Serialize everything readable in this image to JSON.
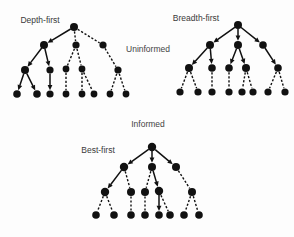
{
  "figure": {
    "width": 294,
    "height": 237,
    "background_color": "#fdfdfd",
    "node_color": "#111111",
    "edge_color": "#111111",
    "label_color": "#3a3a3a"
  },
  "section_labels": [
    {
      "text": "Uninformed",
      "x": 148,
      "y": 52
    },
    {
      "text": "Informed",
      "x": 148,
      "y": 127
    }
  ],
  "trees": [
    {
      "id": "depth-first",
      "label": "Depth-first",
      "label_x": 40,
      "label_y": 23,
      "nodes": [
        {
          "id": "n0",
          "x": 74,
          "y": 27,
          "r": 4.0
        },
        {
          "id": "n1",
          "x": 44,
          "y": 45,
          "r": 4.0
        },
        {
          "id": "n2",
          "x": 76,
          "y": 45,
          "r": 3.6
        },
        {
          "id": "n3",
          "x": 103,
          "y": 45,
          "r": 3.6
        },
        {
          "id": "n4",
          "x": 25,
          "y": 70,
          "r": 4.0
        },
        {
          "id": "n5",
          "x": 50,
          "y": 70,
          "r": 3.6
        },
        {
          "id": "n6",
          "x": 66,
          "y": 69,
          "r": 3.4
        },
        {
          "id": "n7",
          "x": 82,
          "y": 69,
          "r": 3.4
        },
        {
          "id": "n8",
          "x": 118,
          "y": 70,
          "r": 3.6
        },
        {
          "id": "n9",
          "x": 17,
          "y": 94,
          "r": 3.8
        },
        {
          "id": "n10",
          "x": 37,
          "y": 94,
          "r": 3.8
        },
        {
          "id": "n11",
          "x": 50,
          "y": 94,
          "r": 3.6
        },
        {
          "id": "n12",
          "x": 66,
          "y": 94,
          "r": 3.4
        },
        {
          "id": "n13",
          "x": 82,
          "y": 94,
          "r": 3.4
        },
        {
          "id": "n14",
          "x": 94,
          "y": 94,
          "r": 3.4
        },
        {
          "id": "n15",
          "x": 110,
          "y": 94,
          "r": 3.4
        },
        {
          "id": "n16",
          "x": 126,
          "y": 94,
          "r": 3.4
        }
      ],
      "edges": [
        {
          "from": "n0",
          "to": "n1",
          "style": "solid",
          "arrow": true
        },
        {
          "from": "n0",
          "to": "n2",
          "style": "dashed",
          "arrow": false
        },
        {
          "from": "n0",
          "to": "n3",
          "style": "dashed",
          "arrow": false
        },
        {
          "from": "n1",
          "to": "n4",
          "style": "solid",
          "arrow": true
        },
        {
          "from": "n1",
          "to": "n5",
          "style": "solid",
          "arrow": true
        },
        {
          "from": "n2",
          "to": "n6",
          "style": "dashed",
          "arrow": false
        },
        {
          "from": "n2",
          "to": "n7",
          "style": "dashed",
          "arrow": false
        },
        {
          "from": "n3",
          "to": "n8",
          "style": "dashed",
          "arrow": false
        },
        {
          "from": "n4",
          "to": "n9",
          "style": "solid",
          "arrow": true
        },
        {
          "from": "n4",
          "to": "n10",
          "style": "solid",
          "arrow": true
        },
        {
          "from": "n5",
          "to": "n11",
          "style": "solid",
          "arrow": true
        },
        {
          "from": "n6",
          "to": "n12",
          "style": "dashed",
          "arrow": false
        },
        {
          "from": "n7",
          "to": "n13",
          "style": "dashed",
          "arrow": false
        },
        {
          "from": "n7",
          "to": "n14",
          "style": "dashed",
          "arrow": false
        },
        {
          "from": "n8",
          "to": "n15",
          "style": "dashed",
          "arrow": false
        },
        {
          "from": "n8",
          "to": "n16",
          "style": "dashed",
          "arrow": false
        }
      ]
    },
    {
      "id": "breadth-first",
      "label": "Breadth-first",
      "label_x": 196,
      "label_y": 21,
      "nodes": [
        {
          "id": "m0",
          "x": 238,
          "y": 25,
          "r": 4.0
        },
        {
          "id": "m1",
          "x": 210,
          "y": 45,
          "r": 4.0
        },
        {
          "id": "m2",
          "x": 238,
          "y": 45,
          "r": 4.0
        },
        {
          "id": "m3",
          "x": 263,
          "y": 45,
          "r": 3.8
        },
        {
          "id": "m4",
          "x": 189,
          "y": 68,
          "r": 4.0
        },
        {
          "id": "m5",
          "x": 212,
          "y": 68,
          "r": 3.8
        },
        {
          "id": "m6",
          "x": 229,
          "y": 68,
          "r": 3.8
        },
        {
          "id": "m7",
          "x": 246,
          "y": 68,
          "r": 4.0
        },
        {
          "id": "m8",
          "x": 278,
          "y": 68,
          "r": 3.8
        },
        {
          "id": "m9",
          "x": 180,
          "y": 92,
          "r": 3.6
        },
        {
          "id": "m10",
          "x": 198,
          "y": 92,
          "r": 3.6
        },
        {
          "id": "m11",
          "x": 212,
          "y": 92,
          "r": 3.6
        },
        {
          "id": "m12",
          "x": 229,
          "y": 92,
          "r": 3.6
        },
        {
          "id": "m13",
          "x": 242,
          "y": 92,
          "r": 3.6
        },
        {
          "id": "m14",
          "x": 253,
          "y": 92,
          "r": 3.6
        },
        {
          "id": "m15",
          "x": 268,
          "y": 92,
          "r": 3.6
        },
        {
          "id": "m16",
          "x": 285,
          "y": 92,
          "r": 3.6
        }
      ],
      "edges": [
        {
          "from": "m0",
          "to": "m1",
          "style": "solid",
          "arrow": true
        },
        {
          "from": "m0",
          "to": "m2",
          "style": "solid",
          "arrow": true
        },
        {
          "from": "m0",
          "to": "m3",
          "style": "solid",
          "arrow": true
        },
        {
          "from": "m1",
          "to": "m4",
          "style": "solid",
          "arrow": true
        },
        {
          "from": "m1",
          "to": "m5",
          "style": "solid",
          "arrow": true
        },
        {
          "from": "m2",
          "to": "m6",
          "style": "solid",
          "arrow": true
        },
        {
          "from": "m2",
          "to": "m7",
          "style": "solid",
          "arrow": true
        },
        {
          "from": "m3",
          "to": "m8",
          "style": "solid",
          "arrow": true
        },
        {
          "from": "m4",
          "to": "m9",
          "style": "dashed",
          "arrow": false
        },
        {
          "from": "m4",
          "to": "m10",
          "style": "dashed",
          "arrow": false
        },
        {
          "from": "m5",
          "to": "m11",
          "style": "dashed",
          "arrow": false
        },
        {
          "from": "m6",
          "to": "m12",
          "style": "dashed",
          "arrow": false
        },
        {
          "from": "m7",
          "to": "m13",
          "style": "dashed",
          "arrow": false
        },
        {
          "from": "m7",
          "to": "m14",
          "style": "dashed",
          "arrow": false
        },
        {
          "from": "m8",
          "to": "m15",
          "style": "dashed",
          "arrow": false
        },
        {
          "from": "m8",
          "to": "m16",
          "style": "dashed",
          "arrow": false
        }
      ]
    },
    {
      "id": "best-first",
      "label": "Best-first",
      "label_x": 98,
      "label_y": 153,
      "nodes": [
        {
          "id": "b0",
          "x": 152,
          "y": 147,
          "r": 4.2
        },
        {
          "id": "b1",
          "x": 124,
          "y": 167,
          "r": 4.2
        },
        {
          "id": "b2",
          "x": 152,
          "y": 167,
          "r": 4.0
        },
        {
          "id": "b3",
          "x": 176,
          "y": 167,
          "r": 4.0
        },
        {
          "id": "b4",
          "x": 105,
          "y": 192,
          "r": 4.2
        },
        {
          "id": "b5",
          "x": 131,
          "y": 192,
          "r": 4.0
        },
        {
          "id": "b6",
          "x": 145,
          "y": 192,
          "r": 4.0
        },
        {
          "id": "b7",
          "x": 159,
          "y": 191,
          "r": 4.2
        },
        {
          "id": "b8",
          "x": 192,
          "y": 192,
          "r": 4.0
        },
        {
          "id": "b9",
          "x": 96,
          "y": 215,
          "r": 3.8
        },
        {
          "id": "b10",
          "x": 114,
          "y": 215,
          "r": 3.8
        },
        {
          "id": "b11",
          "x": 131,
          "y": 215,
          "r": 3.8
        },
        {
          "id": "b12",
          "x": 145,
          "y": 215,
          "r": 3.8
        },
        {
          "id": "b13",
          "x": 159,
          "y": 215,
          "r": 3.8
        },
        {
          "id": "b14",
          "x": 170,
          "y": 215,
          "r": 3.8
        },
        {
          "id": "b15",
          "x": 184,
          "y": 215,
          "r": 3.8
        },
        {
          "id": "b16",
          "x": 199,
          "y": 215,
          "r": 3.8
        }
      ],
      "edges": [
        {
          "from": "b0",
          "to": "b1",
          "style": "solid",
          "arrow": true
        },
        {
          "from": "b0",
          "to": "b2",
          "style": "solid",
          "arrow": true
        },
        {
          "from": "b0",
          "to": "b3",
          "style": "solid",
          "arrow": true
        },
        {
          "from": "b1",
          "to": "b4",
          "style": "solid",
          "arrow": true
        },
        {
          "from": "b1",
          "to": "b5",
          "style": "dashed",
          "arrow": false
        },
        {
          "from": "b2",
          "to": "b6",
          "style": "dashed",
          "arrow": false
        },
        {
          "from": "b2",
          "to": "b7",
          "style": "solid",
          "arrow": true
        },
        {
          "from": "b3",
          "to": "b8",
          "style": "dashed",
          "arrow": false
        },
        {
          "from": "b4",
          "to": "b9",
          "style": "dashed",
          "arrow": false
        },
        {
          "from": "b4",
          "to": "b10",
          "style": "dashed",
          "arrow": false
        },
        {
          "from": "b5",
          "to": "b11",
          "style": "dashed",
          "arrow": false
        },
        {
          "from": "b6",
          "to": "b12",
          "style": "dashed",
          "arrow": false
        },
        {
          "from": "b7",
          "to": "b13",
          "style": "solid",
          "arrow": true
        },
        {
          "from": "b7",
          "to": "b14",
          "style": "dashed",
          "arrow": false
        },
        {
          "from": "b8",
          "to": "b15",
          "style": "dashed",
          "arrow": false
        },
        {
          "from": "b8",
          "to": "b16",
          "style": "dashed",
          "arrow": false
        }
      ]
    }
  ]
}
